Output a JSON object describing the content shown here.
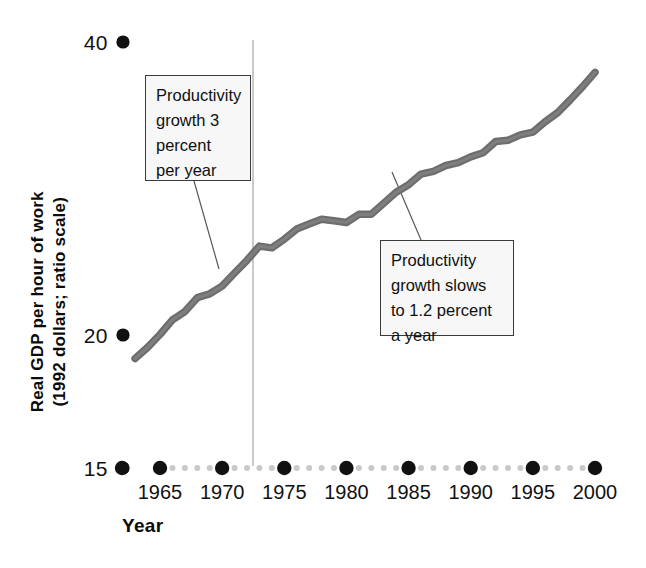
{
  "chart_data": {
    "type": "line",
    "title": "",
    "subtitle": "",
    "xlabel": "Year",
    "ylabel": "Real GDP per hour of work (1992 dollars; ratio scale)",
    "ylabel_line1": "Real GDP per hour of work",
    "ylabel_line2": "(1992 dollars; ratio scale)",
    "scale": "log",
    "grid": false,
    "legend": "none",
    "xlim": [
      1963,
      2000
    ],
    "ylim": [
      15,
      40
    ],
    "y_tick_labels": [
      "40",
      "20",
      "15"
    ],
    "y_ticks": [
      40,
      20,
      15
    ],
    "x_tick_labels": [
      "1965",
      "1970",
      "1975",
      "1980",
      "1985",
      "1990",
      "1995",
      "2000"
    ],
    "x_ticks": [
      1965,
      1970,
      1975,
      1980,
      1985,
      1990,
      1995,
      2000
    ],
    "series": [
      {
        "name": "Real GDP per hour of work",
        "x": [
          1963,
          1964,
          1965,
          1966,
          1967,
          1968,
          1969,
          1970,
          1971,
          1972,
          1973,
          1974,
          1975,
          1976,
          1977,
          1978,
          1979,
          1980,
          1981,
          1982,
          1983,
          1984,
          1985,
          1986,
          1987,
          1988,
          1989,
          1990,
          1991,
          1992,
          1993,
          1994,
          1995,
          1996,
          1997,
          1998,
          1999,
          2000
        ],
        "values": [
          19.3,
          19.8,
          20.4,
          21.1,
          21.5,
          22.2,
          22.4,
          22.8,
          23.5,
          24.2,
          25.0,
          24.9,
          25.4,
          26.0,
          26.3,
          26.6,
          26.5,
          26.4,
          26.9,
          26.9,
          27.6,
          28.3,
          28.8,
          29.5,
          29.7,
          30.1,
          30.3,
          30.7,
          31.0,
          31.8,
          31.9,
          32.3,
          32.5,
          33.3,
          34.0,
          35.0,
          36.1,
          37.3
        ]
      }
    ],
    "reference_line": {
      "name": "productivity-slowdown-marker",
      "x": 1973,
      "orientation": "vertical",
      "color": "#b9b9b9"
    },
    "annotations": [
      {
        "id": "annotation-growth-3-percent",
        "text": "Productivity growth 3 percent per year",
        "lines": [
          "Productivity",
          "growth 3",
          "percent",
          "per year"
        ],
        "points_to_x": 1967.5,
        "points_to_y": 21.8
      },
      {
        "id": "annotation-growth-slows",
        "text": "Productivity growth slows to 1.2 percent a year",
        "lines": [
          "Productivity",
          "growth slows",
          "to 1.2 percent",
          "a year"
        ],
        "points_to_x": 1980.5,
        "points_to_y": 27.1
      }
    ],
    "colors": {
      "line": "#6b6b6b",
      "axis_major_dot": "#111111",
      "axis_minor_dot": "#c6c6c6",
      "reference_line": "#bdbdbd",
      "callout_background": "#f7f7f7",
      "callout_border": "#3a3a3a",
      "text": "#101010",
      "background": "#ffffff"
    }
  }
}
